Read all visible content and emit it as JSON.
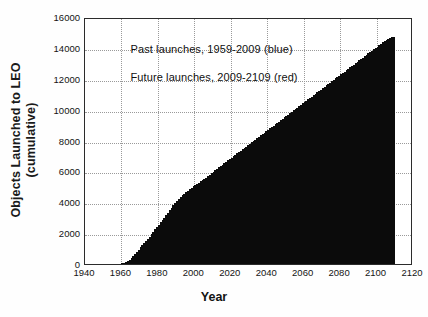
{
  "chart_data": {
    "type": "bar",
    "title": "",
    "xlabel": "Year",
    "ylabel_line1": "Objects Launched to LEO",
    "ylabel_line2": "(cumulative)",
    "xlim": [
      1940,
      2120
    ],
    "ylim": [
      0,
      16000
    ],
    "grid": true,
    "legend_position": "inside-upper-left",
    "xticks": [
      1940,
      1960,
      1980,
      2000,
      2020,
      2040,
      2060,
      2080,
      2100,
      2120
    ],
    "xtick_labels": [
      "1940",
      "1960",
      "1980",
      "2000",
      "2020",
      "2040",
      "2060",
      "2080",
      "2100",
      "2120"
    ],
    "yticks": [
      0,
      2000,
      4000,
      6000,
      8000,
      10000,
      12000,
      14000,
      16000
    ],
    "ytick_labels": [
      "0",
      "2000",
      "4000",
      "6000",
      "8000",
      "10000",
      "12000",
      "14000",
      "16000"
    ],
    "annotations": [
      {
        "name": "past-launches-note",
        "text": "Past launches, 1959-2009 (blue)",
        "x": 1965,
        "y": 14000
      },
      {
        "name": "future-launches-note",
        "text": "Future launches, 2009-2109 (red)",
        "x": 1965,
        "y": 12200
      }
    ],
    "series": [
      {
        "name": "Past launches, 1959-2009 (blue)",
        "color": "#0b0b0b",
        "x": [
          1959,
          1960,
          1961,
          1962,
          1963,
          1964,
          1965,
          1966,
          1967,
          1968,
          1969,
          1970,
          1971,
          1972,
          1973,
          1974,
          1975,
          1976,
          1977,
          1978,
          1979,
          1980,
          1981,
          1982,
          1983,
          1984,
          1985,
          1986,
          1987,
          1988,
          1989,
          1990,
          1991,
          1992,
          1993,
          1994,
          1995,
          1996,
          1997,
          1998,
          1999,
          2000,
          2001,
          2002,
          2003,
          2004,
          2005,
          2006,
          2007,
          2008,
          2009
        ],
        "values": [
          10,
          35,
          70,
          130,
          200,
          290,
          400,
          520,
          650,
          790,
          930,
          1070,
          1210,
          1350,
          1490,
          1630,
          1780,
          1930,
          2080,
          2240,
          2390,
          2540,
          2700,
          2850,
          3000,
          3160,
          3320,
          3480,
          3640,
          3800,
          3950,
          4100,
          4230,
          4340,
          4440,
          4540,
          4640,
          4740,
          4850,
          4940,
          5030,
          5110,
          5190,
          5270,
          5350,
          5430,
          5510,
          5600,
          5690,
          5790,
          5900
        ]
      },
      {
        "name": "Future launches, 2009-2109 (red)",
        "color": "#0b0b0b",
        "x": [
          2010,
          2011,
          2012,
          2013,
          2014,
          2015,
          2016,
          2017,
          2018,
          2019,
          2020,
          2021,
          2022,
          2023,
          2024,
          2025,
          2026,
          2027,
          2028,
          2029,
          2030,
          2031,
          2032,
          2033,
          2034,
          2035,
          2036,
          2037,
          2038,
          2039,
          2040,
          2041,
          2042,
          2043,
          2044,
          2045,
          2046,
          2047,
          2048,
          2049,
          2050,
          2051,
          2052,
          2053,
          2054,
          2055,
          2056,
          2057,
          2058,
          2059,
          2060,
          2061,
          2062,
          2063,
          2064,
          2065,
          2066,
          2067,
          2068,
          2069,
          2070,
          2071,
          2072,
          2073,
          2074,
          2075,
          2076,
          2077,
          2078,
          2079,
          2080,
          2081,
          2082,
          2083,
          2084,
          2085,
          2086,
          2087,
          2088,
          2089,
          2090,
          2091,
          2092,
          2093,
          2094,
          2095,
          2096,
          2097,
          2098,
          2099,
          2100,
          2101,
          2102,
          2103,
          2104,
          2105,
          2106,
          2107,
          2108,
          2109
        ],
        "values": [
          5990,
          6080,
          6170,
          6260,
          6350,
          6440,
          6530,
          6620,
          6710,
          6800,
          6890,
          6980,
          7070,
          7160,
          7250,
          7340,
          7430,
          7520,
          7610,
          7700,
          7790,
          7880,
          7970,
          8060,
          8150,
          8240,
          8330,
          8420,
          8510,
          8600,
          8690,
          8780,
          8870,
          8960,
          9050,
          9140,
          9230,
          9320,
          9410,
          9500,
          9590,
          9680,
          9770,
          9860,
          9950,
          10040,
          10130,
          10220,
          10310,
          10400,
          10490,
          10580,
          10670,
          10760,
          10850,
          10940,
          11030,
          11120,
          11210,
          11300,
          11390,
          11480,
          11570,
          11660,
          11750,
          11840,
          11930,
          12020,
          12110,
          12200,
          12290,
          12380,
          12470,
          12560,
          12650,
          12740,
          12830,
          12920,
          13010,
          13100,
          13190,
          13280,
          13370,
          13460,
          13550,
          13640,
          13730,
          13820,
          13910,
          14000,
          14090,
          14180,
          14270,
          14360,
          14450,
          14540,
          14600,
          14650,
          14690,
          14720
        ]
      }
    ]
  }
}
